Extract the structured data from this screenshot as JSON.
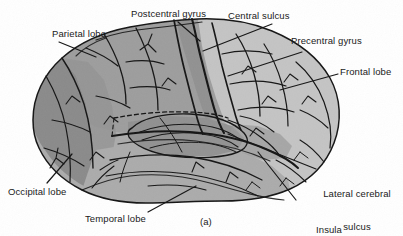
{
  "figure": {
    "caption": "(a)",
    "type": "anatomical-illustration"
  },
  "colors": {
    "background": "#ffffff",
    "occipital_lobe": "#8a8a8a",
    "parietal_lobe": "#9d9d9d",
    "frontal_lobe": "#c4c4c4",
    "temporal_lobe": "#ababab",
    "insula": "#8f8f8f",
    "outline": "#141414",
    "text": "#1a1a1a"
  },
  "labels": {
    "parietal_lobe": "Parietal lobe",
    "postcentral_gyrus": "Postcentral gyrus",
    "central_sulcus": "Central sulcus",
    "precentral_gyrus": "Precentral gyrus",
    "frontal_lobe": "Frontal lobe",
    "lateral_cerebral_sulcus_line1": "Lateral cerebral",
    "lateral_cerebral_sulcus_line2": "sulcus",
    "insula_line1": "Insula",
    "insula_line2": "(projected to surface)",
    "temporal_lobe": "Temporal lobe",
    "occipital_lobe": "Occipital lobe"
  }
}
